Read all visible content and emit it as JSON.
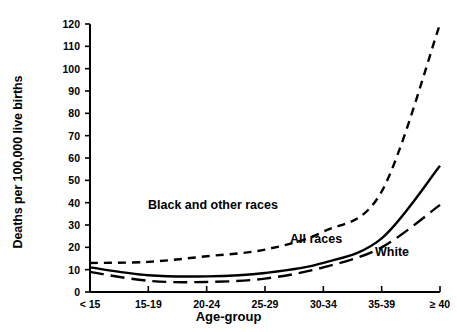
{
  "chart_data": {
    "type": "line",
    "title": "",
    "xlabel": "Age-group",
    "ylabel": "Deaths per 100,000 live births",
    "categories": [
      "< 15",
      "15-19",
      "20-24",
      "25-29",
      "30-34",
      "35-39",
      "≥ 40"
    ],
    "ylim": [
      0,
      120
    ],
    "yticks": [
      0,
      10,
      20,
      30,
      40,
      50,
      60,
      70,
      80,
      90,
      100,
      110,
      120
    ],
    "ytick_labels": [
      "0",
      "10",
      "20",
      "30",
      "40",
      "50",
      "60",
      "70",
      "80",
      "90",
      "100",
      "110",
      "120"
    ],
    "grid": false,
    "legend": "inline-annotations",
    "series": [
      {
        "name": "Black and other races",
        "style": "short-dashed",
        "values": [
          13,
          13.5,
          16,
          19,
          27,
          45,
          120
        ]
      },
      {
        "name": "All races",
        "style": "solid",
        "values": [
          11,
          7.5,
          7,
          8.5,
          13,
          24,
          56.5
        ]
      },
      {
        "name": "White",
        "style": "long-dashed",
        "values": [
          9,
          5,
          4.5,
          6,
          11,
          20,
          39
        ]
      }
    ],
    "annotations": [
      {
        "text": "Black and other races",
        "series": "Black and other races"
      },
      {
        "text": "All races",
        "series": "All races"
      },
      {
        "text": "White",
        "series": "White"
      }
    ]
  },
  "axis": {
    "x_title": "Age-group",
    "y_title": "Deaths per 100,000 live births"
  }
}
